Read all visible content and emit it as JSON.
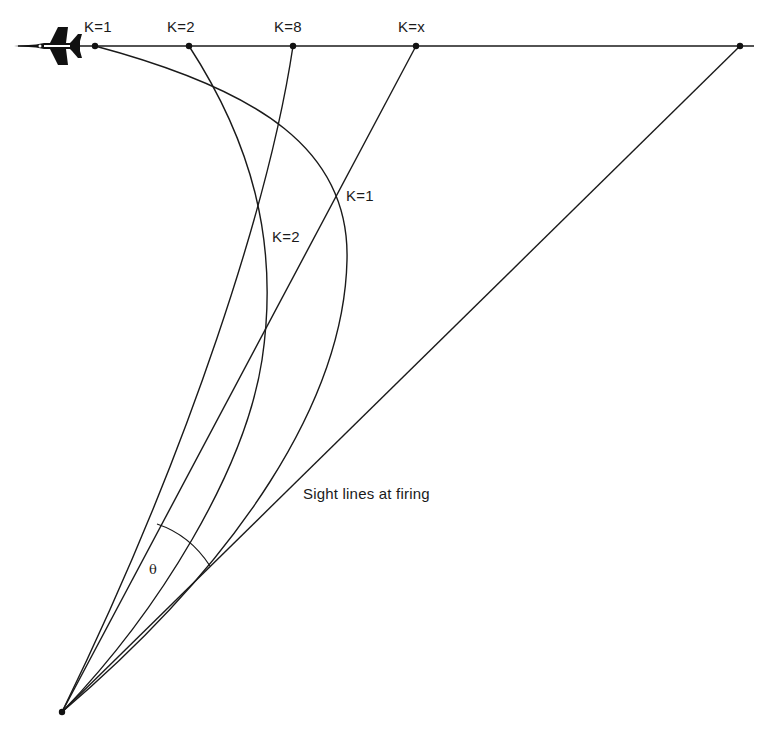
{
  "diagram": {
    "type": "pursuit-curves",
    "target_labels": [
      "K=1",
      "K=2",
      "K=8",
      "K=x"
    ],
    "curve_labels": {
      "k1": "K=1",
      "k2": "K=2"
    },
    "sight_lines_label": "Sight lines at firing",
    "angle_label": "θ",
    "icons": {
      "target_aircraft": "jet-aircraft-icon"
    },
    "colors": {
      "line": "#1a1a1a",
      "background": "#ffffff"
    }
  }
}
